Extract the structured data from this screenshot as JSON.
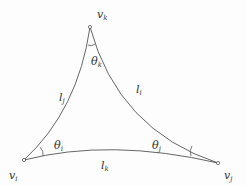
{
  "diagram": {
    "type": "curved triangle with vertex angles",
    "vertices": [
      {
        "id": "vk",
        "symbol": "v",
        "sub": "k",
        "x": 90,
        "y": 27
      },
      {
        "id": "vi",
        "symbol": "v",
        "sub": "i",
        "x": 24,
        "y": 160
      },
      {
        "id": "vj",
        "symbol": "v",
        "sub": "j",
        "x": 218,
        "y": 163
      }
    ],
    "edges": [
      {
        "id": "lj",
        "symbol": "l",
        "sub": "j",
        "from": "vi",
        "to": "vk"
      },
      {
        "id": "li",
        "symbol": "l",
        "sub": "i",
        "from": "vk",
        "to": "vj"
      },
      {
        "id": "lk",
        "symbol": "l",
        "sub": "k",
        "from": "vi",
        "to": "vj"
      }
    ],
    "angles": [
      {
        "id": "theta_i",
        "symbol": "θ",
        "sub": "i",
        "at": "vi"
      },
      {
        "id": "theta_j",
        "symbol": "θ",
        "sub": "j",
        "at": "vj"
      },
      {
        "id": "theta_k",
        "symbol": "θ",
        "sub": "k",
        "at": "vk"
      }
    ],
    "colors": {
      "stroke": "#555555",
      "text": "#333333"
    }
  },
  "labels": {
    "vk": {
      "main": "v",
      "sub": "k"
    },
    "vi": {
      "main": "v",
      "sub": "i"
    },
    "vj": {
      "main": "v",
      "sub": "j"
    },
    "lj": {
      "main": "l",
      "sub": "j"
    },
    "li": {
      "main": "l",
      "sub": "i"
    },
    "lk": {
      "main": "l",
      "sub": "k"
    },
    "theta_i": {
      "main": "θ",
      "sub": "i"
    },
    "theta_j": {
      "main": "θ",
      "sub": "j"
    },
    "theta_k": {
      "main": "θ",
      "sub": "k"
    }
  }
}
